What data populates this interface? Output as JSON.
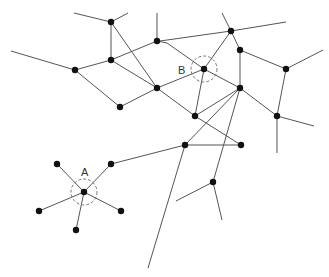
{
  "diagram": {
    "width": 329,
    "height": 277,
    "colors": {
      "edge": "#555555",
      "node": "#111111",
      "ring": "#777777",
      "label": "#333333"
    },
    "highlighted": [
      {
        "id": "A",
        "label": "A",
        "x": 84,
        "y": 192,
        "r": 13,
        "label_x": 81,
        "label_y": 176
      },
      {
        "id": "B",
        "label": "B",
        "x": 204,
        "y": 69,
        "r": 13,
        "label_x": 178,
        "label_y": 74
      }
    ],
    "nodes": [
      {
        "id": "n1",
        "x": 111,
        "y": 22
      },
      {
        "id": "n2",
        "x": 111,
        "y": 60
      },
      {
        "id": "n3",
        "x": 75,
        "y": 70
      },
      {
        "id": "n4",
        "x": 120,
        "y": 107
      },
      {
        "id": "n5",
        "x": 157,
        "y": 41
      },
      {
        "id": "n6",
        "x": 157,
        "y": 88
      },
      {
        "id": "n7",
        "x": 231,
        "y": 31
      },
      {
        "id": "n8",
        "x": 240,
        "y": 50
      },
      {
        "id": "B",
        "x": 204,
        "y": 69
      },
      {
        "id": "n9",
        "x": 240,
        "y": 88
      },
      {
        "id": "n10",
        "x": 286,
        "y": 69
      },
      {
        "id": "n11",
        "x": 195,
        "y": 116
      },
      {
        "id": "n12",
        "x": 277,
        "y": 116
      },
      {
        "id": "n13",
        "x": 185,
        "y": 145
      },
      {
        "id": "n14",
        "x": 241,
        "y": 145
      },
      {
        "id": "n15",
        "x": 213,
        "y": 182
      },
      {
        "id": "A",
        "x": 84,
        "y": 192
      },
      {
        "id": "a1",
        "x": 57,
        "y": 164
      },
      {
        "id": "a2",
        "x": 111,
        "y": 164
      },
      {
        "id": "a3",
        "x": 39,
        "y": 211
      },
      {
        "id": "a4",
        "x": 121,
        "y": 211
      },
      {
        "id": "a5",
        "x": 76,
        "y": 230
      }
    ],
    "edges": [
      [
        74,
        13,
        111,
        22
      ],
      [
        111,
        22,
        128,
        13
      ],
      [
        111,
        22,
        111,
        60
      ],
      [
        111,
        22,
        157,
        88
      ],
      [
        11,
        51,
        75,
        70
      ],
      [
        75,
        70,
        111,
        60
      ],
      [
        75,
        70,
        120,
        107
      ],
      [
        111,
        60,
        157,
        41
      ],
      [
        111,
        60,
        157,
        88
      ],
      [
        157,
        13,
        157,
        41
      ],
      [
        157,
        41,
        167,
        43
      ],
      [
        120,
        107,
        157,
        88
      ],
      [
        160,
        41,
        231,
        31
      ],
      [
        231,
        31,
        286,
        22
      ],
      [
        222,
        13,
        231,
        31
      ],
      [
        231,
        31,
        204,
        69
      ],
      [
        231,
        31,
        240,
        50
      ],
      [
        167,
        43,
        204,
        69
      ],
      [
        157,
        88,
        204,
        69
      ],
      [
        204,
        69,
        240,
        88
      ],
      [
        204,
        69,
        195,
        116
      ],
      [
        240,
        50,
        286,
        69
      ],
      [
        286,
        69,
        323,
        50
      ],
      [
        240,
        50,
        240,
        88
      ],
      [
        286,
        69,
        277,
        116
      ],
      [
        157,
        88,
        195,
        116
      ],
      [
        240,
        88,
        277,
        116
      ],
      [
        277,
        116,
        314,
        126
      ],
      [
        277,
        116,
        277,
        153
      ],
      [
        240,
        88,
        195,
        116
      ],
      [
        240,
        88,
        185,
        145
      ],
      [
        240,
        88,
        213,
        182
      ],
      [
        195,
        116,
        241,
        145
      ],
      [
        185,
        145,
        241,
        145
      ],
      [
        111,
        164,
        185,
        145
      ],
      [
        185,
        145,
        148,
        268
      ],
      [
        213,
        182,
        176,
        201
      ],
      [
        213,
        182,
        222,
        220
      ],
      [
        84,
        192,
        57,
        164
      ],
      [
        84,
        192,
        111,
        164
      ],
      [
        84,
        192,
        39,
        211
      ],
      [
        84,
        192,
        121,
        211
      ],
      [
        84,
        192,
        76,
        230
      ]
    ]
  }
}
